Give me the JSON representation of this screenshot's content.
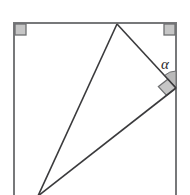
{
  "figure": {
    "width": 190,
    "height": 195,
    "background_color": "#ffffff"
  },
  "colors": {
    "rectangle_stroke": "#77787a",
    "triangle_stroke": "#3a3a3c",
    "marker_fill": "#c6c6c6",
    "marker_stroke": "#6e6f71",
    "angle_fill": "#b9b9b9",
    "angle_stroke": "#6e6f71",
    "label_color": "#2b2b2b"
  },
  "rectangle": {
    "name": "bounding-rectangle",
    "left": 14,
    "top": 23,
    "right": 176,
    "bottom": 195,
    "stroke_width": 2,
    "clipped_at_bottom": true
  },
  "corner_markers": [
    {
      "name": "right-angle-top-left",
      "x": 14,
      "y": 23,
      "size": 11,
      "orientation": "down-right",
      "label": "90"
    },
    {
      "name": "right-angle-top-right",
      "x": 176,
      "y": 23,
      "size": 11,
      "orientation": "down-left",
      "label": "90"
    }
  ],
  "triangle": {
    "name": "inscribed-triangle",
    "stroke_width": 1.6,
    "vertices": [
      {
        "name": "apex-top",
        "x": 117,
        "y": 24,
        "on": "top-edge"
      },
      {
        "name": "vertex-right",
        "x": 176,
        "y": 88,
        "on": "right-edge"
      },
      {
        "name": "vertex-bottom",
        "x": 38,
        "y": 196,
        "on": "below-bottom-edge"
      }
    ],
    "edges": [
      {
        "name": "edge-apex-to-right",
        "from": "apex-top",
        "to": "vertex-right"
      },
      {
        "name": "edge-right-to-bottom",
        "from": "vertex-right",
        "to": "vertex-bottom"
      },
      {
        "name": "edge-bottom-to-apex",
        "from": "vertex-bottom",
        "to": "apex-top"
      }
    ]
  },
  "angles": [
    {
      "name": "angle-alpha",
      "label": "α",
      "vertex_x": 176,
      "vertex_y": 88,
      "radius": 17,
      "filled": true,
      "between": [
        "right-edge-upward",
        "edge-apex-to-right"
      ],
      "label_x": 165,
      "label_y": 66
    },
    {
      "name": "right-angle-triangle-vertex",
      "label": "90",
      "vertex_x": 176,
      "vertex_y": 88,
      "size": 12,
      "filled": true,
      "between": [
        "edge-apex-to-right",
        "edge-right-to-bottom"
      ]
    }
  ]
}
